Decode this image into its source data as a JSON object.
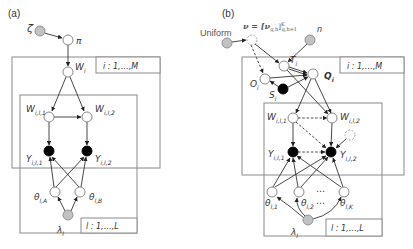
{
  "panel_a": {
    "label": "(a)",
    "nodes": {
      "zeta": {
        "label": "ζ",
        "type": "hyperparameter"
      },
      "pi": {
        "label": "π",
        "type": "latent"
      },
      "W_i": {
        "label": "W",
        "sub": "i",
        "type": "latent"
      },
      "W_il1": {
        "label": "W",
        "sub": "i,l,1",
        "type": "latent"
      },
      "W_il2": {
        "label": "W",
        "sub": "i,l,2",
        "type": "latent"
      },
      "Y_il1": {
        "label": "Y",
        "sub": "i,l,1",
        "type": "observed"
      },
      "Y_il2": {
        "label": "Y",
        "sub": "i,l,2",
        "type": "observed"
      },
      "theta_lA": {
        "label": "θ",
        "sub": "l,A",
        "type": "latent"
      },
      "theta_lB": {
        "label": "θ",
        "sub": "l,B",
        "type": "latent"
      },
      "lambda_l": {
        "label": "λ",
        "sub": "l",
        "type": "hyperparameter"
      }
    },
    "plates": {
      "i": {
        "label": "i : 1,…,M"
      },
      "l": {
        "label": "l : 1,…,L"
      }
    }
  },
  "panel_b": {
    "label": "(b)",
    "nodes": {
      "uniform": {
        "label": "Uniform",
        "type": "hyperparameter"
      },
      "nu": {
        "label": "ν = [ν",
        "sub": "g,h",
        "tail": "]",
        "sup": "K",
        "range": "g,h=1",
        "type": "latent-dashed"
      },
      "n": {
        "label": "n",
        "type": "hyperparameter"
      },
      "T_i": {
        "label": "T",
        "sub": "i",
        "type": "latent"
      },
      "Q_i": {
        "label": "Q",
        "sub": "i",
        "type": "latent"
      },
      "O_i": {
        "label": "O",
        "sub": "i",
        "type": "latent"
      },
      "S_i": {
        "label": "S",
        "sub": "i",
        "type": "observed"
      },
      "W_il1": {
        "label": "W",
        "sub": "i,l,1",
        "type": "latent"
      },
      "W_il2": {
        "label": "W",
        "sub": "i,l,2",
        "type": "latent"
      },
      "Y_il1": {
        "label": "Y",
        "sub": "i,l,1",
        "type": "observed"
      },
      "Y_il2": {
        "label": "Y",
        "sub": "i,l,2",
        "type": "observed"
      },
      "theta_l1": {
        "label": "θ",
        "sub": "l,1",
        "type": "latent"
      },
      "theta_l2": {
        "label": "θ",
        "sub": "l,2",
        "type": "latent"
      },
      "theta_lK": {
        "label": "θ",
        "sub": "l,K",
        "type": "latent"
      },
      "lambda_l": {
        "label": "λ",
        "sub": "l",
        "type": "hyperparameter"
      },
      "ellipsis": "⋯"
    },
    "plates": {
      "i": {
        "label": "i : 1,…,M"
      },
      "l": {
        "label": "l : 1,…,L"
      }
    }
  }
}
